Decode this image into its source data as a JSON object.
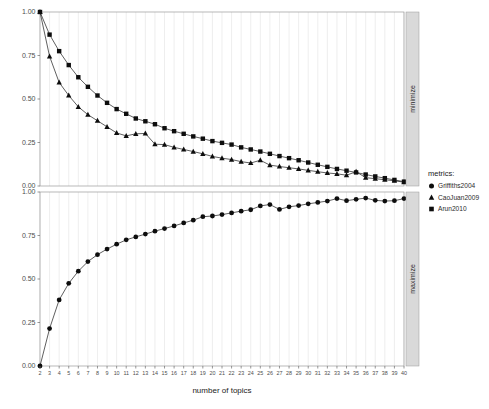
{
  "chart_data": {
    "type": "line",
    "title": "",
    "xlabel": "number of topics",
    "ylabel": "",
    "xlim": [
      2,
      40
    ],
    "ylim": [
      0,
      1
    ],
    "grid": "vertical",
    "legend_position": "right",
    "legend_title": "metrics:",
    "x": [
      2,
      3,
      4,
      5,
      6,
      7,
      8,
      9,
      10,
      11,
      12,
      13,
      14,
      15,
      16,
      17,
      18,
      19,
      20,
      21,
      22,
      23,
      24,
      25,
      26,
      27,
      28,
      29,
      30,
      31,
      32,
      33,
      34,
      35,
      36,
      37,
      38,
      39,
      40
    ],
    "xtick_labels": [
      "2",
      "3",
      "4",
      "5",
      "6",
      "7",
      "8",
      "9",
      "10",
      "11",
      "12",
      "13",
      "14",
      "15",
      "16",
      "17",
      "18",
      "19",
      "20",
      "21",
      "22",
      "23",
      "24",
      "25",
      "26",
      "27",
      "28",
      "29",
      "30",
      "31",
      "32",
      "33",
      "34",
      "35",
      "36",
      "37",
      "38",
      "39",
      "40"
    ],
    "ytick_labels": [
      "0.00",
      "0.25",
      "0.50",
      "0.75",
      "1.00"
    ],
    "ytick_values": [
      0.0,
      0.25,
      0.5,
      0.75,
      1.0
    ],
    "panels": [
      {
        "strip_label": "minimize",
        "series": [
          {
            "name": "CaoJuan2009",
            "marker": "triangle",
            "values": [
              1.0,
              0.745,
              0.595,
              0.52,
              0.455,
              0.41,
              0.375,
              0.34,
              0.305,
              0.288,
              0.3,
              0.302,
              0.24,
              0.238,
              0.222,
              0.21,
              0.198,
              0.185,
              0.17,
              0.16,
              0.152,
              0.14,
              0.132,
              0.148,
              0.12,
              0.112,
              0.105,
              0.098,
              0.09,
              0.082,
              0.075,
              0.07,
              0.062,
              0.082,
              0.048,
              0.042,
              0.036,
              0.03,
              0.022
            ]
          },
          {
            "name": "Arun2010",
            "marker": "square",
            "values": [
              1.0,
              0.87,
              0.775,
              0.695,
              0.625,
              0.57,
              0.52,
              0.478,
              0.442,
              0.415,
              0.388,
              0.372,
              0.355,
              0.332,
              0.315,
              0.3,
              0.285,
              0.272,
              0.258,
              0.248,
              0.238,
              0.222,
              0.21,
              0.198,
              0.185,
              0.172,
              0.16,
              0.148,
              0.135,
              0.122,
              0.11,
              0.098,
              0.088,
              0.078,
              0.066,
              0.055,
              0.045,
              0.035,
              0.025
            ]
          }
        ]
      },
      {
        "strip_label": "maximize",
        "series": [
          {
            "name": "Griffiths2004",
            "marker": "circle",
            "values": [
              0.0,
              0.215,
              0.38,
              0.475,
              0.545,
              0.6,
              0.64,
              0.672,
              0.7,
              0.725,
              0.742,
              0.758,
              0.775,
              0.79,
              0.805,
              0.822,
              0.838,
              0.858,
              0.862,
              0.87,
              0.88,
              0.89,
              0.898,
              0.92,
              0.928,
              0.9,
              0.915,
              0.922,
              0.932,
              0.94,
              0.948,
              0.962,
              0.95,
              0.958,
              0.965,
              0.952,
              0.948,
              0.95,
              0.962
            ]
          }
        ]
      }
    ],
    "legend_entries": [
      {
        "label": "Griffiths2004",
        "marker": "circle"
      },
      {
        "label": "CaoJuan2009",
        "marker": "triangle"
      },
      {
        "label": "Arun2010",
        "marker": "square"
      }
    ]
  }
}
